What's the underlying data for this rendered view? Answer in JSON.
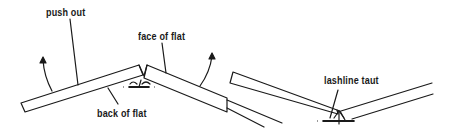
{
  "figure": {
    "left_panel": {
      "description": "Two flats hinged at an angle, pushed out to open the joint",
      "labels": {
        "push_out": "push out",
        "face_of_flat": "face of flat",
        "back_of_flat": "back of flat"
      }
    },
    "right_panel": {
      "description": "Two flats pulled together with lashline taut",
      "labels": {
        "lashline_taut": "lashline taut"
      }
    },
    "colors": {
      "ink": "#1a1a1a",
      "background": "#ffffff"
    }
  }
}
